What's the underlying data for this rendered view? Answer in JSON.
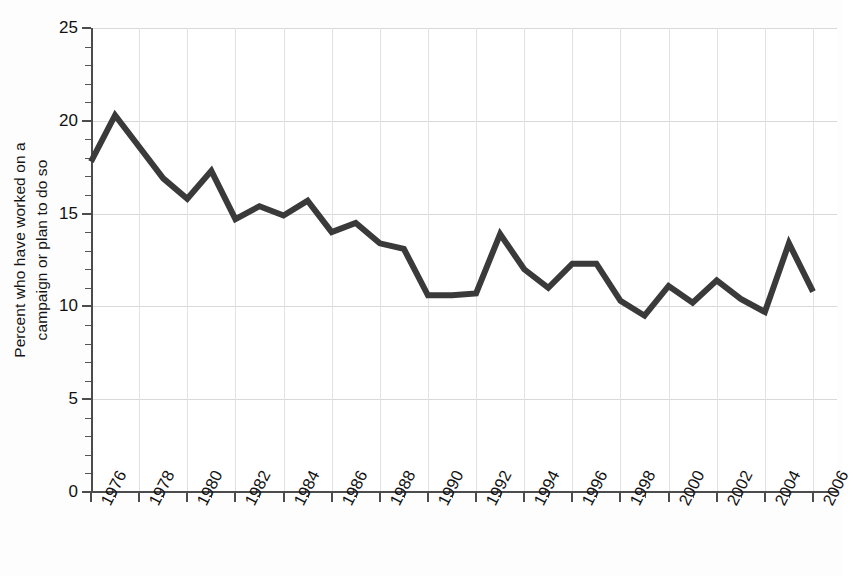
{
  "chart_data": {
    "type": "line",
    "title": "",
    "subtitle": "",
    "xlabel": "",
    "ylabel": "Percent who have worked on a campaign or plan to do so",
    "ylabel_lines": [
      "Percent who have worked on a",
      "campaign or plan to do so"
    ],
    "ylim": [
      0,
      25
    ],
    "yticks": [
      0,
      5,
      10,
      15,
      20,
      25
    ],
    "ytick_labels": [
      "0",
      "5",
      "10",
      "15",
      "20",
      "25"
    ],
    "y_minor_tick_step": 1,
    "xlim": [
      1976,
      2006
    ],
    "xticks": [
      1976,
      1978,
      1980,
      1982,
      1984,
      1986,
      1988,
      1990,
      1992,
      1994,
      1996,
      1998,
      2000,
      2002,
      2004,
      2006
    ],
    "xtick_labels": [
      "1976",
      "1978",
      "1980",
      "1982",
      "1984",
      "1986",
      "1988",
      "1990",
      "1992",
      "1994",
      "1996",
      "1998",
      "2000",
      "2002",
      "2004",
      "2006"
    ],
    "x_minor_tick_step": 1,
    "grid": "horizontal-and-vertical-at-major-ticks",
    "legend": "none",
    "line_color": "#3a3a3a",
    "line_width": 6,
    "x": [
      1976,
      1977,
      1978,
      1979,
      1980,
      1981,
      1982,
      1983,
      1984,
      1985,
      1986,
      1987,
      1988,
      1989,
      1990,
      1991,
      1992,
      1993,
      1994,
      1995,
      1996,
      1997,
      1998,
      1999,
      2000,
      2001,
      2002,
      2003,
      2004,
      2005,
      2006
    ],
    "values": [
      17.8,
      20.3,
      18.6,
      16.9,
      15.8,
      17.3,
      14.7,
      15.4,
      14.9,
      15.7,
      14.0,
      14.5,
      13.4,
      13.1,
      10.6,
      10.6,
      10.7,
      13.9,
      12.0,
      11.0,
      12.3,
      12.3,
      10.3,
      9.5,
      11.1,
      10.2,
      11.4,
      10.4,
      9.7,
      13.4,
      10.8
    ],
    "series": [
      {
        "name": "Percent who have worked on a campaign or plan to do so",
        "values": [
          17.8,
          20.3,
          18.6,
          16.9,
          15.8,
          17.3,
          14.7,
          15.4,
          14.9,
          15.7,
          14.0,
          14.5,
          13.4,
          13.1,
          10.6,
          10.6,
          10.7,
          13.9,
          12.0,
          11.0,
          12.3,
          12.3,
          10.3,
          9.5,
          11.1,
          10.2,
          11.4,
          10.4,
          9.7,
          13.4,
          10.8
        ]
      }
    ]
  },
  "colors": {
    "line": "#3a3a3a",
    "axis": "#4c4c4c",
    "gridline": "#d9d9d9",
    "text": "#111111",
    "background": "#ffffff"
  }
}
